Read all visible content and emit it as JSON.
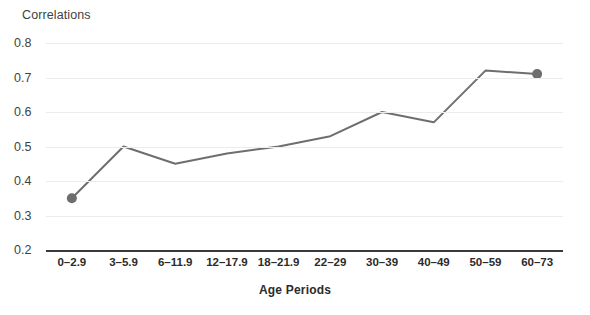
{
  "chart_data": {
    "type": "line",
    "title": "",
    "ylabel": "Correlations",
    "xlabel": "Age Periods",
    "categories": [
      "0–2.9",
      "3–5.9",
      "6–11.9",
      "12–17.9",
      "18–21.9",
      "22–29",
      "30–39",
      "40–49",
      "50–59",
      "60–73"
    ],
    "values": [
      0.35,
      0.5,
      0.45,
      0.48,
      0.5,
      0.53,
      0.6,
      0.57,
      0.72,
      0.71
    ],
    "ylim": [
      0.2,
      0.8
    ],
    "ytick_labels": [
      "0.8",
      "0.7",
      "0.6",
      "0.5",
      "0.4",
      "0.3",
      "0.2"
    ],
    "ytick_values": [
      0.8,
      0.7,
      0.6,
      0.5,
      0.4,
      0.3,
      0.2
    ],
    "grid": true,
    "legend": "none",
    "markers_shown": [
      "0–2.9",
      "60–73"
    ],
    "series_color": "#6e6e6e",
    "grid_color": "#ececec",
    "axis_color": "#3a3a3a",
    "background_color": "#ffffff"
  }
}
